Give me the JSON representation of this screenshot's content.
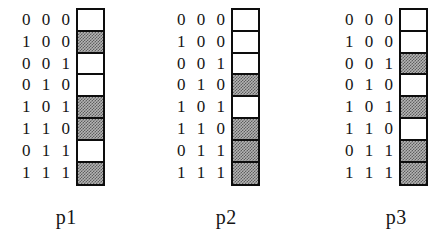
{
  "figure": {
    "caption_row_labels": [
      "0 0 0",
      "1 0 0",
      "0 0 1",
      "0 1 0",
      "1 0 1",
      "1 1 0",
      "0 1 1",
      "1 1 1"
    ],
    "columns": [
      {
        "name": "p1",
        "label": "p1",
        "cells": [
          "white",
          "gray",
          "white",
          "white",
          "gray",
          "gray",
          "white",
          "gray"
        ]
      },
      {
        "name": "p2",
        "label": "p2",
        "cells": [
          "white",
          "white",
          "white",
          "gray",
          "white",
          "gray",
          "gray",
          "gray"
        ]
      },
      {
        "name": "p3",
        "label": "p3",
        "cells": [
          "white",
          "white",
          "gray",
          "white",
          "gray",
          "white",
          "gray",
          "gray"
        ]
      }
    ],
    "colors": {
      "shaded": "#b4b4b4",
      "unshaded": "#ffffff",
      "border": "#0d0d0d",
      "text": "#151515"
    }
  },
  "chart_data": {
    "type": "table",
    "title": "",
    "xlabel": "",
    "ylabel": "",
    "categories": [
      "000",
      "100",
      "001",
      "010",
      "101",
      "110",
      "011",
      "111"
    ],
    "legend": [
      "white = 0 (unshaded)",
      "gray = 1 (shaded)"
    ],
    "series": [
      {
        "name": "p1",
        "values": [
          0,
          1,
          0,
          0,
          1,
          1,
          0,
          1
        ]
      },
      {
        "name": "p2",
        "values": [
          0,
          0,
          0,
          1,
          0,
          1,
          1,
          1
        ]
      },
      {
        "name": "p3",
        "values": [
          0,
          0,
          1,
          0,
          1,
          0,
          1,
          1
        ]
      }
    ]
  }
}
